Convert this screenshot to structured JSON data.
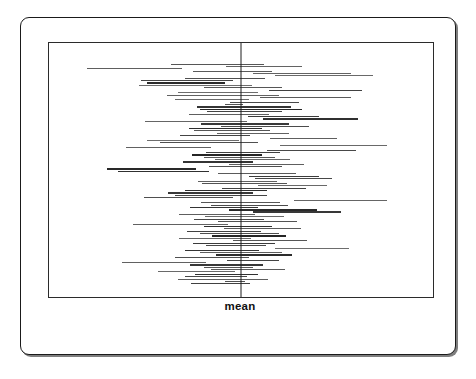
{
  "figure": {
    "axis_label": "mean",
    "background_color": "#ffffff",
    "outer_frame_color": "#1a1a1a",
    "inner_frame_color": "#2b2b2b"
  },
  "chart_data": {
    "type": "line",
    "title": "",
    "subtitle": "",
    "xlabel": "mean",
    "ylabel": "",
    "grid": false,
    "legend": null,
    "annotations": [
      {
        "text": "mean",
        "x": 0,
        "position": "below-axis",
        "style": "bold"
      }
    ],
    "reference_line": {
      "orientation": "vertical",
      "x": 0.0,
      "label": "mean",
      "color": "#1a1a1a"
    },
    "xlim": [
      -1.0,
      1.0
    ],
    "ylim": [
      0,
      93
    ],
    "series_count": 93,
    "segments": [
      {
        "y": 0,
        "x0": -0.365,
        "x1": 0.118,
        "shade": 0.62
      },
      {
        "y": 1,
        "x0": -0.08,
        "x1": 0.32,
        "shade": 0.55
      },
      {
        "y": 2,
        "x0": -0.8,
        "x1": -0.305,
        "shade": 0.58
      },
      {
        "y": 3,
        "x0": -0.25,
        "x1": 0.16,
        "shade": 0.6
      },
      {
        "y": 4,
        "x0": 0.06,
        "x1": 0.575,
        "shade": 0.55
      },
      {
        "y": 5,
        "x0": 0.175,
        "x1": 0.69,
        "shade": 0.52
      },
      {
        "y": 6,
        "x0": -0.29,
        "x1": 0.125,
        "shade": 0.66
      },
      {
        "y": 7,
        "x0": -0.52,
        "x1": -0.04,
        "shade": 0.72
      },
      {
        "y": 8,
        "x0": -0.49,
        "x1": -0.085,
        "shade": 0.85
      },
      {
        "y": 9,
        "x0": -0.53,
        "x1": 0.055,
        "shade": 0.5
      },
      {
        "y": 10,
        "x0": -0.195,
        "x1": 0.215,
        "shade": 0.62
      },
      {
        "y": 11,
        "x0": 0.145,
        "x1": 0.63,
        "shade": 0.74
      },
      {
        "y": 12,
        "x0": -0.33,
        "x1": 0.088,
        "shade": 0.5
      },
      {
        "y": 13,
        "x0": -0.385,
        "x1": 0.2,
        "shade": 0.56
      },
      {
        "y": 14,
        "x0": 0.1,
        "x1": 0.575,
        "shade": 0.6
      },
      {
        "y": 15,
        "x0": -0.345,
        "x1": 0.042,
        "shade": 0.52
      },
      {
        "y": 16,
        "x0": -0.055,
        "x1": 0.3,
        "shade": 0.7
      },
      {
        "y": 17,
        "x0": -0.085,
        "x1": 0.01,
        "shade": 0.64
      },
      {
        "y": 18,
        "x0": -0.23,
        "x1": 0.26,
        "shade": 0.8
      },
      {
        "y": 19,
        "x0": -0.215,
        "x1": 0.32,
        "shade": 0.88
      },
      {
        "y": 20,
        "x0": -0.175,
        "x1": 0.215,
        "shade": 0.72
      },
      {
        "y": 21,
        "x0": -0.27,
        "x1": 0.145,
        "shade": 0.58
      },
      {
        "y": 22,
        "x0": 0.035,
        "x1": 0.405,
        "shade": 0.76
      },
      {
        "y": 23,
        "x0": 0.115,
        "x1": 0.61,
        "shade": 0.82
      },
      {
        "y": 24,
        "x0": -0.5,
        "x1": 0.03,
        "shade": 0.54
      },
      {
        "y": 25,
        "x0": -0.21,
        "x1": 0.25,
        "shade": 0.78
      },
      {
        "y": 26,
        "x0": -0.105,
        "x1": 0.355,
        "shade": 0.68
      },
      {
        "y": 27,
        "x0": -0.27,
        "x1": 0.108,
        "shade": 0.84
      },
      {
        "y": 28,
        "x0": -0.245,
        "x1": 0.15,
        "shade": 0.62
      },
      {
        "y": 29,
        "x0": -0.125,
        "x1": 0.252,
        "shade": 0.56
      },
      {
        "y": 30,
        "x0": -0.32,
        "x1": 0.045,
        "shade": 0.72
      },
      {
        "y": 31,
        "x0": 0.15,
        "x1": 0.5,
        "shade": 0.58
      },
      {
        "y": 32,
        "x0": -0.49,
        "x1": -0.01,
        "shade": 0.5
      },
      {
        "y": 33,
        "x0": -0.42,
        "x1": 0.09,
        "shade": 0.66
      },
      {
        "y": 34,
        "x0": 0.205,
        "x1": 0.76,
        "shade": 0.52
      },
      {
        "y": 35,
        "x0": -0.6,
        "x1": -0.155,
        "shade": 0.56
      },
      {
        "y": 36,
        "x0": 0.138,
        "x1": 0.6,
        "shade": 0.7
      },
      {
        "y": 37,
        "x0": -0.18,
        "x1": 0.205,
        "shade": 0.74
      },
      {
        "y": 38,
        "x0": -0.255,
        "x1": 0.108,
        "shade": 0.88
      },
      {
        "y": 39,
        "x0": -0.195,
        "x1": 0.175,
        "shade": 0.62
      },
      {
        "y": 40,
        "x0": -0.135,
        "x1": 0.255,
        "shade": 0.54
      },
      {
        "y": 41,
        "x0": -0.3,
        "x1": 0.06,
        "shade": 0.8
      },
      {
        "y": 42,
        "x0": -0.06,
        "x1": 0.33,
        "shade": 0.58
      },
      {
        "y": 43,
        "x0": -0.165,
        "x1": 0.215,
        "shade": 0.66
      },
      {
        "y": 44,
        "x0": -0.7,
        "x1": -0.235,
        "shade": 0.86
      },
      {
        "y": 45,
        "x0": -0.64,
        "x1": -0.165,
        "shade": 0.82
      },
      {
        "y": 46,
        "x0": -0.12,
        "x1": 0.288,
        "shade": 0.6
      },
      {
        "y": 47,
        "x0": 0.04,
        "x1": 0.405,
        "shade": 0.76
      },
      {
        "y": 48,
        "x0": 0.075,
        "x1": 0.475,
        "shade": 0.7
      },
      {
        "y": 49,
        "x0": -0.225,
        "x1": 0.185,
        "shade": 0.56
      },
      {
        "y": 50,
        "x0": -0.205,
        "x1": 0.24,
        "shade": 0.64
      },
      {
        "y": 51,
        "x0": 0.09,
        "x1": 0.45,
        "shade": 0.52
      },
      {
        "y": 52,
        "x0": -0.1,
        "x1": 0.34,
        "shade": 0.74
      },
      {
        "y": 53,
        "x0": -0.29,
        "x1": 0.138,
        "shade": 0.84
      },
      {
        "y": 54,
        "x0": -0.38,
        "x1": 0.065,
        "shade": 0.78
      },
      {
        "y": 55,
        "x0": -0.345,
        "x1": 0.135,
        "shade": 0.72
      },
      {
        "y": 56,
        "x0": -0.505,
        "x1": -0.04,
        "shade": 0.66
      },
      {
        "y": 57,
        "x0": 0.275,
        "x1": 0.76,
        "shade": 0.54
      },
      {
        "y": 58,
        "x0": -0.21,
        "x1": 0.205,
        "shade": 0.62
      },
      {
        "y": 59,
        "x0": -0.155,
        "x1": 0.245,
        "shade": 0.68
      },
      {
        "y": 60,
        "x0": -0.265,
        "x1": 0.09,
        "shade": 0.8
      },
      {
        "y": 61,
        "x0": -0.06,
        "x1": 0.395,
        "shade": 0.86
      },
      {
        "y": 62,
        "x0": 0.065,
        "x1": 0.52,
        "shade": 0.78
      },
      {
        "y": 63,
        "x0": -0.325,
        "x1": 0.075,
        "shade": 0.58
      },
      {
        "y": 64,
        "x0": -0.185,
        "x1": 0.225,
        "shade": 0.52
      },
      {
        "y": 65,
        "x0": -0.245,
        "x1": 0.12,
        "shade": 0.7
      },
      {
        "y": 66,
        "x0": -0.12,
        "x1": 0.29,
        "shade": 0.64
      },
      {
        "y": 67,
        "x0": -0.56,
        "x1": -0.07,
        "shade": 0.56
      },
      {
        "y": 68,
        "x0": -0.195,
        "x1": 0.16,
        "shade": 0.82
      },
      {
        "y": 69,
        "x0": -0.09,
        "x1": 0.31,
        "shade": 0.6
      },
      {
        "y": 70,
        "x0": -0.28,
        "x1": 0.105,
        "shade": 0.74
      },
      {
        "y": 71,
        "x0": -0.215,
        "x1": 0.2,
        "shade": 0.66
      },
      {
        "y": 72,
        "x0": -0.15,
        "x1": 0.235,
        "shade": 0.88
      },
      {
        "y": 73,
        "x0": -0.325,
        "x1": 0.05,
        "shade": 0.54
      },
      {
        "y": 74,
        "x0": -0.04,
        "x1": 0.345,
        "shade": 0.62
      },
      {
        "y": 75,
        "x0": -0.25,
        "x1": 0.175,
        "shade": 0.76
      },
      {
        "y": 76,
        "x0": -0.18,
        "x1": 0.13,
        "shade": 0.7
      },
      {
        "y": 77,
        "x0": 0.175,
        "x1": 0.565,
        "shade": 0.5
      },
      {
        "y": 78,
        "x0": -0.29,
        "x1": 0.095,
        "shade": 0.8
      },
      {
        "y": 79,
        "x0": -0.215,
        "x1": 0.215,
        "shade": 0.58
      },
      {
        "y": 80,
        "x0": -0.13,
        "x1": 0.265,
        "shade": 0.84
      },
      {
        "y": 81,
        "x0": -0.345,
        "x1": 0.04,
        "shade": 0.66
      },
      {
        "y": 82,
        "x0": -0.075,
        "x1": 0.2,
        "shade": 0.72
      },
      {
        "y": 83,
        "x0": -0.62,
        "x1": -0.18,
        "shade": 0.56
      },
      {
        "y": 84,
        "x0": -0.265,
        "x1": 0.115,
        "shade": 0.78
      },
      {
        "y": 85,
        "x0": -0.195,
        "x1": 0.06,
        "shade": 0.64
      },
      {
        "y": 86,
        "x0": -0.155,
        "x1": 0.23,
        "shade": 0.6
      },
      {
        "y": 87,
        "x0": -0.43,
        "x1": -0.03,
        "shade": 0.52
      },
      {
        "y": 88,
        "x0": -0.24,
        "x1": 0.09,
        "shade": 0.82
      },
      {
        "y": 89,
        "x0": -0.29,
        "x1": 0.03,
        "shade": 0.7
      },
      {
        "y": 90,
        "x0": -0.33,
        "x1": 0.14,
        "shade": 0.58
      },
      {
        "y": 91,
        "x0": -0.085,
        "x1": 0.02,
        "shade": 0.66
      },
      {
        "y": 92,
        "x0": -0.26,
        "x1": 0.045,
        "shade": 0.74
      }
    ]
  }
}
